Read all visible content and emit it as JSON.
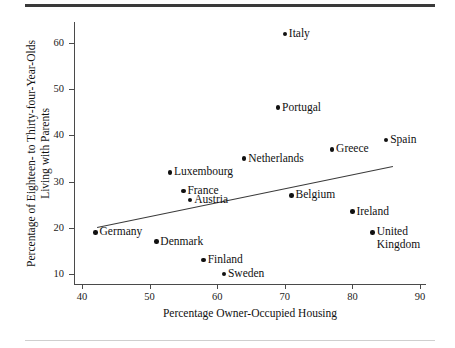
{
  "figure": {
    "rule_top": "horizontal-rule",
    "rule_bottom": "horizontal-rule"
  },
  "chart_data": {
    "type": "scatter",
    "title": "",
    "xlabel": "Percentage Owner-Occupied Housing",
    "ylabel_line1": "Percentage of Eighteen- to Thirty-four-Year-Olds",
    "ylabel_line2": "Living with Parents",
    "xlim": [
      38,
      92
    ],
    "ylim": [
      8.5,
      64
    ],
    "xticks": [
      40,
      50,
      60,
      70,
      80,
      90
    ],
    "yticks": [
      10,
      20,
      30,
      40,
      50,
      60
    ],
    "grid": false,
    "legend": "none",
    "points": [
      {
        "label": "Italy",
        "x": 70,
        "y": 62,
        "label_pos": "right"
      },
      {
        "label": "Portugal",
        "x": 69,
        "y": 46,
        "label_pos": "right"
      },
      {
        "label": "Spain",
        "x": 85,
        "y": 39,
        "label_pos": "right"
      },
      {
        "label": "Greece",
        "x": 77,
        "y": 37,
        "label_pos": "right"
      },
      {
        "label": "Netherlands",
        "x": 64,
        "y": 35,
        "label_pos": "right"
      },
      {
        "label": "Luxembourg",
        "x": 53,
        "y": 32,
        "label_pos": "right"
      },
      {
        "label": "France",
        "x": 55,
        "y": 28,
        "label_pos": "right"
      },
      {
        "label": "Austria",
        "x": 56,
        "y": 26,
        "label_pos": "right"
      },
      {
        "label": "Belgium",
        "x": 71,
        "y": 27,
        "label_pos": "right"
      },
      {
        "label": "Ireland",
        "x": 80,
        "y": 23.5,
        "label_pos": "right"
      },
      {
        "label": "United Kingdom",
        "x": 83,
        "y": 19,
        "label_pos": "right"
      },
      {
        "label": "Germany",
        "x": 42,
        "y": 19,
        "label_pos": "right"
      },
      {
        "label": "Denmark",
        "x": 51,
        "y": 17,
        "label_pos": "right"
      },
      {
        "label": "Finland",
        "x": 58,
        "y": 13,
        "label_pos": "right"
      },
      {
        "label": "Sweden",
        "x": 61,
        "y": 10,
        "label_pos": "right"
      }
    ],
    "fit_line": {
      "x0": 42.2,
      "y0": 20.2,
      "x1": 86.0,
      "y1": 33.4
    }
  }
}
